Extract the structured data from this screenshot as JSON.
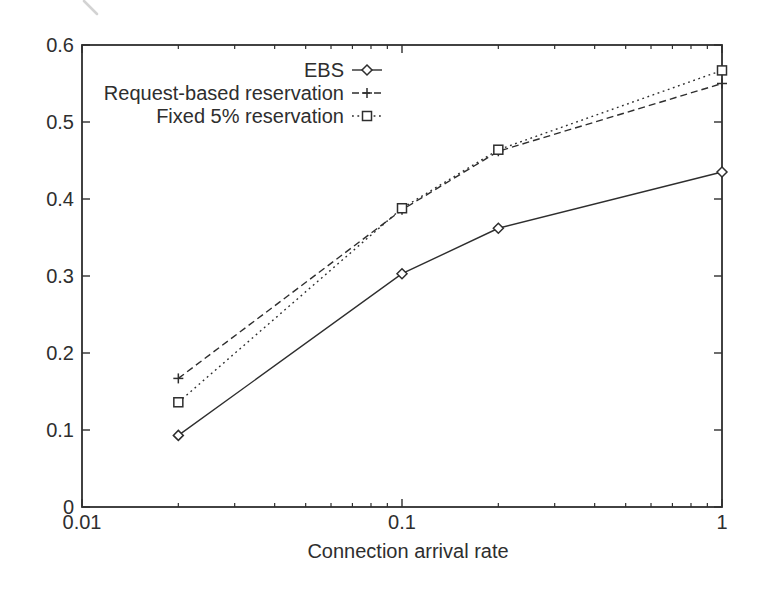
{
  "figure": {
    "background": "#ffffff",
    "ink_color": "#2e2e2e"
  },
  "chart_data": {
    "type": "line",
    "title": "",
    "xlabel": "Connection arrival rate",
    "ylabel": "",
    "x_scale": "log",
    "xlim": [
      0.01,
      1
    ],
    "ylim": [
      0,
      0.6
    ],
    "x_ticks": [
      0.01,
      0.1,
      1
    ],
    "x_tick_labels": [
      "0.01",
      "0.1",
      "1"
    ],
    "y_ticks": [
      0,
      0.1,
      0.2,
      0.3,
      0.4,
      0.5,
      0.6
    ],
    "y_tick_labels": [
      "0",
      "0.1",
      "0.2",
      "0.3",
      "0.4",
      "0.5",
      "0.6"
    ],
    "grid": false,
    "legend_position": "inside-top-center",
    "x": [
      0.02,
      0.1,
      0.2,
      1
    ],
    "series": [
      {
        "name": "EBS",
        "values": [
          0.093,
          0.303,
          0.362,
          0.435
        ],
        "line": "solid",
        "marker": "diamond"
      },
      {
        "name": "Request-based reservation",
        "values": [
          0.167,
          0.386,
          0.462,
          0.55
        ],
        "line": "dashed",
        "marker": "plus"
      },
      {
        "name": "Fixed 5% reservation",
        "values": [
          0.136,
          0.388,
          0.464,
          0.567
        ],
        "line": "dotted",
        "marker": "square"
      }
    ]
  }
}
